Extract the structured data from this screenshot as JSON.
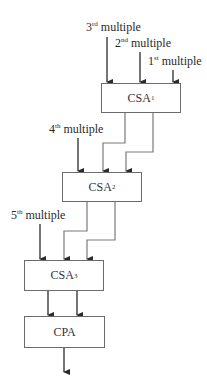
{
  "inputs": [
    {
      "ordinal": "3",
      "suffix": "rd",
      "text": " multiple"
    },
    {
      "ordinal": "2",
      "suffix": "nd",
      "text": " multiple"
    },
    {
      "ordinal": "1",
      "suffix": "st",
      "text": " multiple"
    },
    {
      "ordinal": "4",
      "suffix": "th",
      "text": " multiple"
    },
    {
      "ordinal": "5",
      "suffix": "th",
      "text": " multiple"
    }
  ],
  "blocks": [
    {
      "name": "CSA",
      "index": "1"
    },
    {
      "name": "CSA",
      "index": "2"
    },
    {
      "name": "CSA",
      "index": "3"
    },
    {
      "name": "CPA",
      "index": ""
    }
  ],
  "colors": {
    "line": "#2a2a2a",
    "box_border": "#6b6b6b",
    "connector": "#7a7a7a"
  }
}
